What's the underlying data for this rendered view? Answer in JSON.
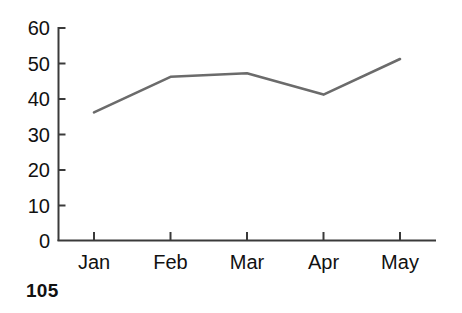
{
  "figure": {
    "number_label": "105",
    "background_color": "#ffffff"
  },
  "chart_data": {
    "type": "line",
    "title": "",
    "subtitle": "",
    "xlabel": "",
    "ylabel": "",
    "categories": [
      "Jan",
      "Feb",
      "Mar",
      "Apr",
      "May"
    ],
    "values": [
      36,
      46,
      47,
      41,
      51
    ],
    "series": [
      {
        "name": "",
        "values": [
          36,
          46,
          47,
          41,
          51
        ],
        "color": "#6b6b6b",
        "line_width": 2.6,
        "markers": false
      }
    ],
    "xlim": [
      0,
      6
    ],
    "ylim": [
      0,
      60
    ],
    "yticks": [
      0,
      10,
      20,
      30,
      40,
      50,
      60
    ],
    "ytick_labels": [
      "0",
      "10",
      "20",
      "30",
      "40",
      "50",
      "60"
    ],
    "xtick_labels": [
      "Jan",
      "Feb",
      "Mar",
      "Apr",
      "May"
    ],
    "grid": false,
    "legend": false,
    "legend_position": "none",
    "axis_color": "#3a3a3a",
    "tick_direction": "in",
    "annotations": []
  }
}
